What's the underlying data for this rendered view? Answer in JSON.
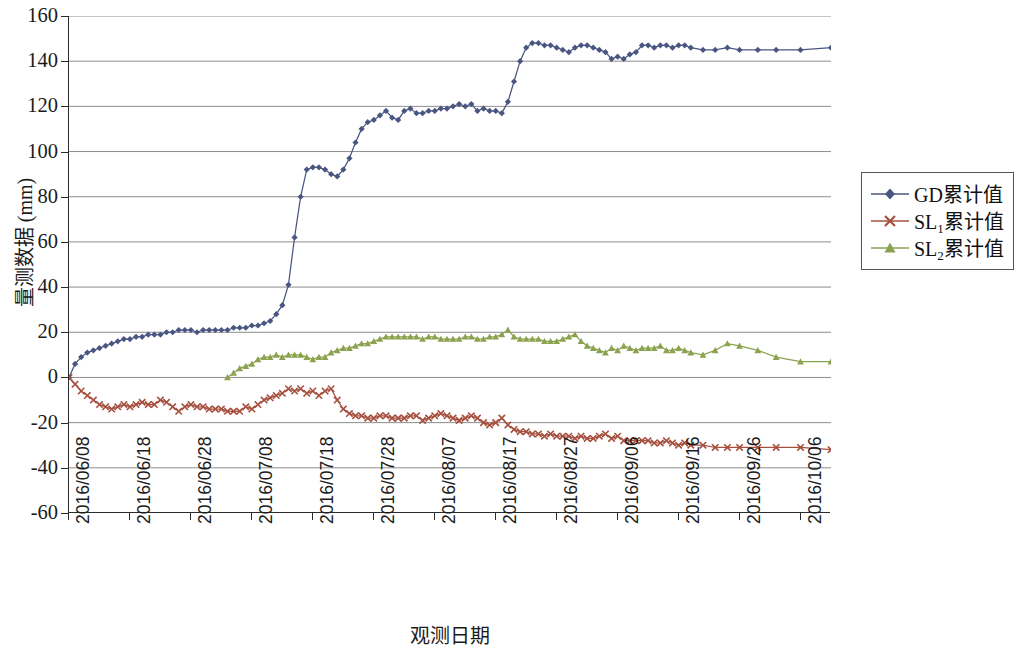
{
  "chart_data": {
    "type": "line",
    "title": "",
    "xlabel": "观测日期",
    "ylabel": "量测数据 (mm)",
    "ylim": [
      -60,
      160
    ],
    "ytick_step": 20,
    "yticks": [
      160,
      140,
      120,
      100,
      80,
      60,
      40,
      20,
      0,
      -20,
      -40,
      -60
    ],
    "grid": "horizontal",
    "legend_position": "right",
    "x_start_date": "2016/06/08",
    "x_end_date": "2016/10/11",
    "x_total_days": 125,
    "xticks": [
      "2016/06/08",
      "2016/06/18",
      "2016/06/28",
      "2016/07/08",
      "2016/07/18",
      "2016/07/28",
      "2016/08/07",
      "2016/08/17",
      "2016/08/27",
      "2016/09/06",
      "2016/09/16",
      "2016/09/26",
      "2016/10/06"
    ],
    "series": [
      {
        "name": "GD累计值",
        "color": "#4a5682",
        "marker": "diamond",
        "x": [
          0,
          1,
          2,
          3,
          4,
          5,
          6,
          7,
          8,
          9,
          10,
          11,
          12,
          13,
          14,
          15,
          16,
          17,
          18,
          19,
          20,
          21,
          22,
          23,
          24,
          25,
          26,
          27,
          28,
          29,
          30,
          31,
          32,
          33,
          34,
          35,
          36,
          37,
          38,
          39,
          40,
          41,
          42,
          43,
          44,
          45,
          46,
          47,
          48,
          49,
          50,
          51,
          52,
          53,
          54,
          55,
          56,
          57,
          58,
          59,
          60,
          61,
          62,
          63,
          64,
          65,
          66,
          67,
          68,
          69,
          70,
          71,
          72,
          73,
          74,
          75,
          76,
          77,
          78,
          79,
          80,
          81,
          82,
          83,
          84,
          85,
          86,
          87,
          88,
          89,
          90,
          91,
          92,
          93,
          94,
          95,
          96,
          97,
          98,
          99,
          100,
          101,
          102,
          104,
          106,
          108,
          110,
          113,
          116,
          120,
          125
        ],
        "values": [
          0,
          6,
          9,
          11,
          12,
          13,
          14,
          15,
          16,
          17,
          17,
          18,
          18,
          19,
          19,
          19,
          20,
          20,
          21,
          21,
          21,
          20,
          21,
          21,
          21,
          21,
          21,
          22,
          22,
          22,
          23,
          23,
          24,
          25,
          28,
          32,
          41,
          62,
          80,
          92,
          93,
          93,
          92,
          90,
          89,
          92,
          97,
          104,
          110,
          113,
          114,
          116,
          118,
          115,
          114,
          118,
          119,
          117,
          117,
          118,
          118,
          119,
          119,
          120,
          121,
          120,
          121,
          118,
          119,
          118,
          118,
          117,
          122,
          131,
          140,
          146,
          148,
          148,
          147,
          147,
          146,
          145,
          144,
          146,
          147,
          147,
          146,
          145,
          144,
          141,
          142,
          141,
          143,
          144,
          147,
          147,
          146,
          147,
          147,
          146,
          147,
          147,
          146,
          145,
          145,
          146,
          145,
          145,
          145,
          145,
          146
        ]
      },
      {
        "name": "SL₁累计值",
        "color": "#a6503f",
        "marker": "x",
        "x": [
          0,
          1,
          2,
          3,
          4,
          5,
          6,
          7,
          8,
          9,
          10,
          11,
          12,
          13,
          14,
          15,
          16,
          17,
          18,
          19,
          20,
          21,
          22,
          23,
          24,
          25,
          26,
          27,
          28,
          29,
          30,
          31,
          32,
          33,
          34,
          35,
          36,
          37,
          38,
          39,
          40,
          41,
          42,
          43,
          44,
          45,
          46,
          47,
          48,
          49,
          50,
          51,
          52,
          53,
          54,
          55,
          56,
          57,
          58,
          59,
          60,
          61,
          62,
          63,
          64,
          65,
          66,
          67,
          68,
          69,
          70,
          71,
          72,
          73,
          74,
          75,
          76,
          77,
          78,
          79,
          80,
          81,
          82,
          83,
          84,
          85,
          86,
          87,
          88,
          89,
          90,
          91,
          92,
          93,
          94,
          95,
          96,
          97,
          98,
          99,
          100,
          101,
          102,
          104,
          106,
          108,
          110,
          113,
          116,
          120,
          125
        ],
        "values": [
          0,
          -3,
          -6,
          -8,
          -10,
          -12,
          -13,
          -14,
          -13,
          -12,
          -13,
          -12,
          -11,
          -12,
          -12,
          -10,
          -11,
          -13,
          -15,
          -13,
          -12,
          -13,
          -13,
          -14,
          -14,
          -14,
          -15,
          -15,
          -15,
          -13,
          -14,
          -12,
          -10,
          -9,
          -8,
          -7,
          -5,
          -6,
          -5,
          -7,
          -6,
          -8,
          -6,
          -5,
          -10,
          -14,
          -16,
          -17,
          -17,
          -18,
          -18,
          -17,
          -17,
          -18,
          -18,
          -18,
          -17,
          -17,
          -19,
          -18,
          -17,
          -16,
          -17,
          -18,
          -19,
          -18,
          -17,
          -18,
          -20,
          -21,
          -20,
          -18,
          -21,
          -23,
          -24,
          -24,
          -25,
          -25,
          -26,
          -25,
          -26,
          -26,
          -26,
          -27,
          -26,
          -27,
          -27,
          -26,
          -25,
          -27,
          -26,
          -28,
          -28,
          -28,
          -28,
          -28,
          -29,
          -29,
          -28,
          -29,
          -30,
          -29,
          -30,
          -30,
          -31,
          -31,
          -31,
          -31,
          -31,
          -31,
          -32
        ]
      },
      {
        "name": "SL₂累计值",
        "color": "#8ba24f",
        "marker": "triangle",
        "x": [
          26,
          27,
          28,
          29,
          30,
          31,
          32,
          33,
          34,
          35,
          36,
          37,
          38,
          39,
          40,
          41,
          42,
          43,
          44,
          45,
          46,
          47,
          48,
          49,
          50,
          51,
          52,
          53,
          54,
          55,
          56,
          57,
          58,
          59,
          60,
          61,
          62,
          63,
          64,
          65,
          66,
          67,
          68,
          69,
          70,
          71,
          72,
          73,
          74,
          75,
          76,
          77,
          78,
          79,
          80,
          81,
          82,
          83,
          84,
          85,
          86,
          87,
          88,
          89,
          90,
          91,
          92,
          93,
          94,
          95,
          96,
          97,
          98,
          99,
          100,
          101,
          102,
          104,
          106,
          108,
          110,
          113,
          116,
          120,
          125
        ],
        "values": [
          0,
          2,
          4,
          5,
          6,
          8,
          9,
          9,
          10,
          9,
          10,
          10,
          10,
          9,
          8,
          9,
          9,
          11,
          12,
          13,
          13,
          14,
          15,
          15,
          16,
          17,
          18,
          18,
          18,
          18,
          18,
          18,
          17,
          18,
          18,
          17,
          17,
          17,
          17,
          18,
          18,
          17,
          17,
          18,
          18,
          19,
          21,
          18,
          17,
          17,
          17,
          17,
          16,
          16,
          16,
          17,
          18,
          19,
          16,
          14,
          13,
          12,
          11,
          13,
          12,
          14,
          13,
          12,
          13,
          13,
          13,
          14,
          12,
          12,
          13,
          12,
          11,
          10,
          12,
          15,
          14,
          12,
          9,
          7,
          7
        ]
      }
    ]
  },
  "axes": {
    "y_title": "量测数据 (mm)",
    "x_title": "观测日期"
  },
  "legend": {
    "items": [
      {
        "label_main": "GD累计值",
        "sub": ""
      },
      {
        "label_prefix": "SL",
        "sub": "1",
        "label_suffix": "累计值"
      },
      {
        "label_prefix": "SL",
        "sub": "2",
        "label_suffix": "累计值"
      }
    ],
    "item0_label": "GD累计值",
    "item1_prefix": "SL",
    "item1_sub": "1",
    "item1_suffix": "累计值",
    "item2_prefix": "SL",
    "item2_sub": "2",
    "item2_suffix": "累计值"
  },
  "colors": {
    "series_gd": "#4a5682",
    "series_sl1": "#a6503f",
    "series_sl2": "#8ba24f",
    "grid": "#808080",
    "axis": "#2b2b2b"
  }
}
